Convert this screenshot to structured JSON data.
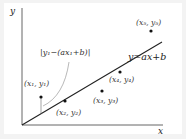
{
  "diagram": {
    "axes": {
      "x_label": "x",
      "y_label": "y"
    },
    "line": {
      "label": "y=ax+b"
    },
    "residual_label": "|y₁−(ax₁+b)|",
    "points": [
      {
        "id": "p1",
        "label": "(x₁, y₁)"
      },
      {
        "id": "p2",
        "label": "(x₂, y₂)"
      },
      {
        "id": "p3",
        "label": "(x₃, y₃)"
      },
      {
        "id": "p4",
        "label": "(x₄, y₄)"
      },
      {
        "id": "p5",
        "label": "(x₅, y₅)"
      }
    ],
    "colors": {
      "background": "#f3f3f3",
      "plot": "#ffffff",
      "ink": "#222222",
      "leader": "#888888"
    }
  }
}
